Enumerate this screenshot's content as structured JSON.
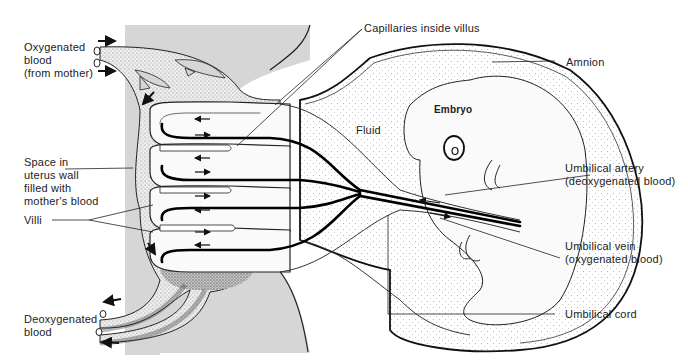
{
  "diagram": {
    "colors": {
      "uterus_wall": "#d4d4d4",
      "blood_space": "#e9e9e9",
      "stipple": "#9a9a9a",
      "line": "#1a1a1a",
      "capillary": "#000000",
      "fluid": "#fbfbfb"
    },
    "labels": {
      "oxygenated_blood": [
        "Oxygenated",
        "blood",
        "(from mother)"
      ],
      "space_in_uterus": [
        "Space in",
        "uterus wall",
        "filled with",
        "mother's blood"
      ],
      "villi": "Villi",
      "deoxygenated_blood": [
        "Deoxygenated",
        "blood"
      ],
      "capillaries": "Capillaries inside villus",
      "amnion": "Amnion",
      "embryo": "Embryo",
      "fluid": "Fluid",
      "umbilical_artery": [
        "Umbilical artery",
        "(deoxygenated blood)"
      ],
      "umbilical_vein": [
        "Umbilical vein",
        "(oxygenated blood)"
      ],
      "umbilical_cord": "Umbilical cord"
    },
    "arrows": {
      "inflow": "right-arrow",
      "outflow": "left-arrow",
      "flow_in_space": "down-arrow"
    }
  }
}
